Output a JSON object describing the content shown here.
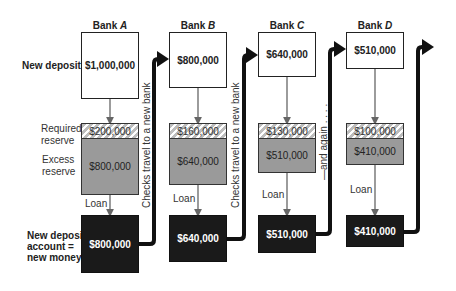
{
  "row_labels": {
    "new_deposits": "New deposits",
    "required_reserve": [
      "Required",
      "reserve"
    ],
    "excess_reserve": [
      "Excess",
      "reserve"
    ],
    "loan": "Loan",
    "new_deposit_account": [
      "New deposit",
      "account =",
      "new money"
    ]
  },
  "connectors": {
    "checks_travel": "Checks travel to a new bank",
    "and_again": "—and again . . . ."
  },
  "banks": [
    {
      "name_prefix": "Bank ",
      "name_letter": "A",
      "deposit": "$1,000,000",
      "required_reserve": "$200,000",
      "excess_reserve": "$800,000",
      "loan_label": "Loan",
      "new_deposit": "$800,000"
    },
    {
      "name_prefix": "Bank ",
      "name_letter": "B",
      "deposit": "$800,000",
      "required_reserve": "$160,000",
      "excess_reserve": "$640,000",
      "loan_label": "Loan",
      "new_deposit": "$640,000"
    },
    {
      "name_prefix": "Bank ",
      "name_letter": "C",
      "deposit": "$640,000",
      "required_reserve": "$130,000",
      "excess_reserve": "$510,000",
      "loan_label": "Loan",
      "new_deposit": "$510,000"
    },
    {
      "name_prefix": "Bank ",
      "name_letter": "D",
      "deposit": "$510,000",
      "required_reserve": "$100,000",
      "excess_reserve": "$410,000",
      "loan_label": "Loan",
      "new_deposit": "$410,000"
    }
  ],
  "colors": {
    "deposit_fill": "#ffffff",
    "reserve_fill": "#9a9a9a",
    "loan_fill": "#1a1a1a",
    "arrow": "#111111",
    "thin_arrow": "#666666"
  }
}
